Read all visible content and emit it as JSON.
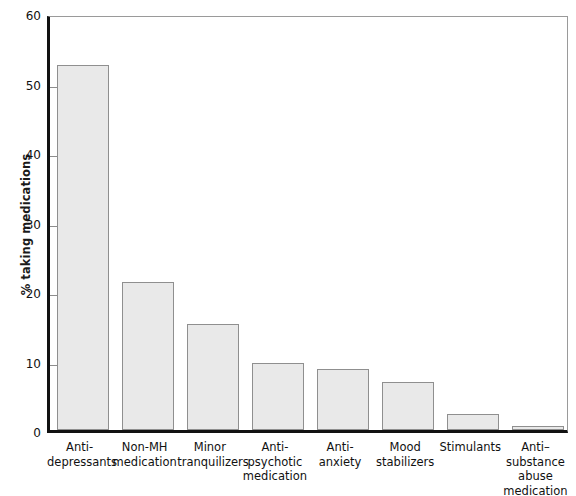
{
  "chart_data": {
    "type": "bar",
    "title": "",
    "xlabel": "",
    "ylabel": "% taking medications",
    "ylim": [
      0,
      60
    ],
    "yticks": [
      0,
      10,
      20,
      30,
      40,
      50,
      60
    ],
    "ytick_labels": [
      "0",
      "10",
      "20",
      "30",
      "40",
      "50",
      "60"
    ],
    "grid": false,
    "legend": "none",
    "categories": [
      "Anti-\ndepressants",
      "Non-MH\nmedication",
      "Minor\ntranquilizers",
      "Anti-\npsychotic\nmedication",
      "Anti-\nanxiety",
      "Mood\nstabilizers",
      "Stimulants",
      "Anti–\nsubstance\nabuse\nmedication"
    ],
    "values": [
      52.5,
      21.3,
      15.2,
      9.7,
      8.8,
      6.9,
      2.3,
      0.6
    ],
    "bar_fill_color": "#e9e9e9",
    "bar_edge_color": "#8f8f8f",
    "axis_color": "#111111"
  }
}
